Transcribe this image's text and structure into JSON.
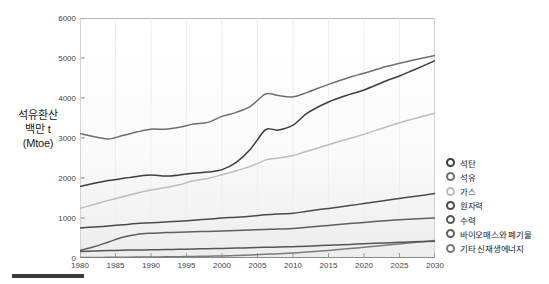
{
  "axis_caption": {
    "line1": "석유환산",
    "line2": "백만 t",
    "line3": "(Mtoe)"
  },
  "legend": {
    "items": [
      {
        "label": "석탄",
        "color": "#3d3d3d",
        "marker": "legend-marker-coal"
      },
      {
        "label": "석유",
        "color": "#6e6e6e",
        "marker": "legend-marker-oil"
      },
      {
        "label": "가스",
        "color": "#bdbdbd",
        "marker": "legend-marker-gas"
      },
      {
        "label": "원자력",
        "color": "#4a4a4a",
        "marker": "legend-marker-nuclear"
      },
      {
        "label": "수력",
        "color": "#555555",
        "marker": "legend-marker-hydro"
      },
      {
        "label": "바이오매스와 폐기물",
        "color": "#5f5f5f",
        "marker": "legend-marker-biomass"
      },
      {
        "label": "기타 신재생에너지",
        "color": "#7a7a7a",
        "marker": "legend-marker-other-renewables"
      }
    ]
  },
  "chart_data": {
    "type": "line",
    "title": "",
    "xlabel": "",
    "ylabel": "석유환산 백만 t (Mtoe)",
    "xlim": [
      1980,
      2030
    ],
    "ylim": [
      0,
      6000
    ],
    "yticks": [
      0,
      1000,
      2000,
      3000,
      4000,
      5000,
      6000
    ],
    "xticks": [
      1980,
      1985,
      1990,
      1995,
      2000,
      2005,
      2010,
      2015,
      2020,
      2025,
      2030
    ],
    "grid": false,
    "legend_position": "right",
    "x": [
      1980,
      1982,
      1984,
      1986,
      1988,
      1990,
      1992,
      1994,
      1996,
      1998,
      2000,
      2002,
      2004,
      2006,
      2007,
      2008,
      2010,
      2012,
      2015,
      2018,
      2020,
      2023,
      2025,
      2027,
      2030
    ],
    "series": [
      {
        "name": "석유",
        "color": "#6e6e6e",
        "values": [
          3110,
          3030,
          2975,
          3060,
          3150,
          3220,
          3220,
          3270,
          3350,
          3390,
          3540,
          3640,
          3790,
          4090,
          4100,
          4060,
          4030,
          4140,
          4340,
          4520,
          4620,
          4780,
          4870,
          4950,
          5060
        ]
      },
      {
        "name": "석탄",
        "color": "#3d3d3d",
        "values": [
          1790,
          1870,
          1935,
          1990,
          2040,
          2075,
          2050,
          2075,
          2120,
          2150,
          2210,
          2390,
          2720,
          3190,
          3220,
          3200,
          3320,
          3620,
          3900,
          4090,
          4200,
          4420,
          4550,
          4700,
          4930
        ]
      },
      {
        "name": "가스",
        "color": "#bdbdbd",
        "values": [
          1240,
          1340,
          1440,
          1530,
          1620,
          1700,
          1760,
          1830,
          1930,
          1990,
          2080,
          2180,
          2290,
          2440,
          2480,
          2500,
          2560,
          2670,
          2830,
          2990,
          3090,
          3270,
          3380,
          3480,
          3620
        ]
      },
      {
        "name": "원자력",
        "color": "#4a4a4a",
        "values": [
          750,
          775,
          800,
          830,
          860,
          880,
          900,
          920,
          945,
          970,
          1000,
          1020,
          1045,
          1080,
          1090,
          1100,
          1120,
          1170,
          1240,
          1310,
          1360,
          1440,
          1490,
          1540,
          1610
        ]
      },
      {
        "name": "바이오매스와 폐기물",
        "color": "#5f5f5f",
        "values": [
          190,
          280,
          400,
          520,
          590,
          620,
          635,
          645,
          655,
          665,
          675,
          690,
          700,
          715,
          720,
          725,
          740,
          770,
          815,
          860,
          890,
          930,
          955,
          975,
          1000
        ]
      },
      {
        "name": "수력",
        "color": "#555555",
        "values": [
          165,
          175,
          185,
          195,
          200,
          205,
          212,
          218,
          225,
          232,
          240,
          248,
          256,
          266,
          270,
          274,
          282,
          296,
          318,
          340,
          355,
          378,
          392,
          404,
          420
        ]
      },
      {
        "name": "기타 신재생에너지",
        "color": "#7a7a7a",
        "values": [
          12,
          14,
          16,
          19,
          22,
          25,
          29,
          33,
          38,
          44,
          52,
          62,
          75,
          92,
          100,
          108,
          126,
          150,
          190,
          235,
          268,
          318,
          352,
          385,
          435
        ]
      }
    ]
  },
  "colors": {
    "plot_border": "#b9b9b9",
    "plot_bg": "#fdfdfd",
    "tick_text": "#444444",
    "caption_text": "#1a1a1a"
  }
}
